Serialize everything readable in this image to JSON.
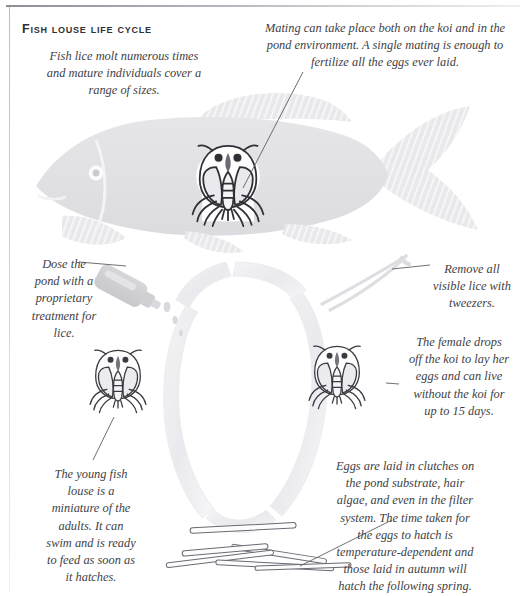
{
  "page": {
    "title": "Fish louse life cycle",
    "background_color": "#ffffff",
    "ink_color": "#3f3f46",
    "silhouette_color": "#e3e3e6",
    "loop_color": "#f1f1f3",
    "rule_color": "#8e8e96"
  },
  "captions": {
    "sizes": "Fish lice molt numerous times\nand mature individuals cover a\nrange of sizes.",
    "mating": "Mating can take place both on the koi and in the\npond environment. A single mating is enough to\nfertilize all the eggs ever laid.",
    "dosing": "Dose the\npond with a\nproprietary\ntreatment for\nlice.",
    "tweezers": "Remove all\nvisible lice with\ntweezers.",
    "female": "The female drops\noff the koi to lay her\neggs and can live\nwithout the koi for\nup to 15 days.",
    "young": "The young fish\nlouse is a\nminiature of the\nadults. It can\nswim and is ready\nto feed as soon as\nit hatches.",
    "eggs": "Eggs are laid in clutches on\nthe pond substrate, hair\nalgae, and even in the filter\nsystem. The time taken for\nthe eggs to hatch is\ntemperature-dependent and\nthose laid in autumn will\nhatch the following spring."
  },
  "figures": {
    "koi": "koi-fish-silhouette",
    "adult_louse_on_koi": "fish-louse-on-koi",
    "juvenile_louse": "juvenile-fish-louse",
    "female_louse": "female-fish-louse",
    "treatment_bottle": "treatment-bottle",
    "tweezers": "tweezers",
    "egg_strands": "egg-laden-algae-strands",
    "cycle_loop": "life-cycle-arrow-loop"
  }
}
